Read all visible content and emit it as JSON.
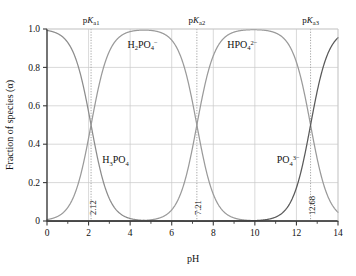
{
  "chart_data": {
    "type": "line",
    "title": "",
    "xlabel": "pH",
    "ylabel": "Fraction of species (α)",
    "xlim": [
      0,
      14
    ],
    "ylim": [
      0,
      1.0
    ],
    "grid": true,
    "legend": "none",
    "x_ticks": [
      0,
      2,
      4,
      6,
      8,
      10,
      12,
      14
    ],
    "x_tick_labels": [
      "0",
      "2",
      "4",
      "6",
      "8",
      "10",
      "12",
      "14"
    ],
    "x_minor_step": 1,
    "y_ticks": [
      0,
      0.2,
      0.4,
      0.6,
      0.8,
      1.0
    ],
    "y_tick_labels": [
      "0",
      "0.2",
      "0.4",
      "0.6",
      "0.8",
      "1.0"
    ],
    "pka_values": [
      2.12,
      7.21,
      12.68
    ],
    "pka_labels": [
      "pKa1",
      "pKa2",
      "pKa3"
    ],
    "pka_value_labels": [
      "2.12",
      "7.21",
      "12.68"
    ],
    "series": [
      {
        "name": "H3PO4",
        "label_parts": {
          "a": "H",
          "b": "3",
          "c": "PO",
          "d": "4",
          "e": ""
        },
        "color": "#8c8c8c",
        "label_x": 3.3,
        "label_y": 0.3
      },
      {
        "name": "H2PO4-",
        "label_parts": {
          "a": "H",
          "b": "2",
          "c": "PO",
          "d": "4",
          "e": "−"
        },
        "color": "#9a9a9a",
        "label_x": 4.6,
        "label_y": 0.9
      },
      {
        "name": "HPO42-",
        "label_parts": {
          "a": "H",
          "b": "",
          "c": "PO",
          "d": "4",
          "e": "2−"
        },
        "color": "#9a9a9a",
        "label_x": 9.4,
        "label_y": 0.9
      },
      {
        "name": "PO43-",
        "label_parts": {
          "a": "",
          "b": "",
          "c": "PO",
          "d": "4",
          "e": "3−"
        },
        "color": "#5a5a5a",
        "label_x": 11.6,
        "label_y": 0.3
      }
    ],
    "curve_points": {
      "note": "alpha fractions computed from triprotic speciation with pKa 2.12, 7.21, 12.68",
      "x": [
        0,
        0.5,
        1.0,
        1.5,
        2.0,
        2.12,
        2.5,
        3.0,
        3.5,
        4.0,
        4.5,
        5.0,
        5.5,
        6.0,
        6.5,
        7.0,
        7.21,
        7.5,
        8.0,
        8.5,
        9.0,
        9.5,
        10.0,
        10.5,
        11.0,
        11.5,
        12.0,
        12.5,
        12.68,
        13.0,
        13.5,
        14.0
      ],
      "H3PO4": [
        0.992,
        0.977,
        0.929,
        0.806,
        0.568,
        0.5,
        0.295,
        0.116,
        0.04,
        0.013,
        0.004,
        0.001,
        0.0,
        0.0,
        0.0,
        0.0,
        0.0,
        0.0,
        0.0,
        0.0,
        0.0,
        0.0,
        0.0,
        0.0,
        0.0,
        0.0,
        0.0,
        0.0,
        0.0,
        0.0,
        0.0,
        0.0
      ],
      "H2PO4": [
        0.008,
        0.023,
        0.071,
        0.194,
        0.432,
        0.5,
        0.705,
        0.884,
        0.96,
        0.987,
        0.996,
        0.999,
        0.999,
        0.998,
        0.995,
        0.618,
        0.5,
        0.339,
        0.14,
        0.049,
        0.016,
        0.005,
        0.002,
        0.0,
        0.0,
        0.0,
        0.0,
        0.0,
        0.0,
        0.0,
        0.0,
        0.0
      ],
      "HPO4": [
        0.0,
        0.0,
        0.0,
        0.0,
        0.0,
        0.0,
        0.0,
        0.0,
        0.0,
        0.0,
        0.0,
        0.001,
        0.003,
        0.006,
        0.048,
        0.382,
        0.5,
        0.661,
        0.86,
        0.95,
        0.983,
        0.994,
        0.995,
        0.985,
        0.955,
        0.869,
        0.657,
        0.56,
        0.5,
        0.323,
        0.12,
        0.04
      ],
      "PO4": [
        0.0,
        0.0,
        0.0,
        0.0,
        0.0,
        0.0,
        0.0,
        0.0,
        0.0,
        0.0,
        0.0,
        0.0,
        0.0,
        0.0,
        0.0,
        0.0,
        0.0,
        0.0,
        0.0,
        0.0,
        0.001,
        0.002,
        0.005,
        0.015,
        0.045,
        0.131,
        0.343,
        0.44,
        0.5,
        0.677,
        0.88,
        0.96
      ]
    },
    "style": {
      "grid_color": "#c9c9c9",
      "axis_color": "#3a3a3a",
      "dotted_line_color": "#9a9a9a",
      "background": "#ffffff"
    }
  }
}
